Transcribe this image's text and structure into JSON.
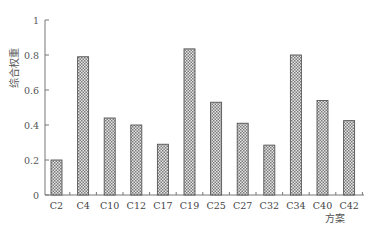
{
  "chart_data": {
    "type": "bar",
    "title": "",
    "xlabel": "方案",
    "ylabel": "综合权重",
    "ylim": [
      0,
      1
    ],
    "yticks": [
      0,
      0.2,
      0.4,
      0.6,
      0.8,
      1
    ],
    "ytick_labels": [
      "0",
      "0.2",
      "0.4",
      "0.6",
      "0.8",
      "1"
    ],
    "grid": false,
    "legend": null,
    "categories": [
      "C2",
      "C4",
      "C10",
      "C12",
      "C17",
      "C19",
      "C25",
      "C27",
      "C32",
      "C34",
      "C40",
      "C42"
    ],
    "values": [
      0.2,
      0.79,
      0.44,
      0.4,
      0.29,
      0.835,
      0.53,
      0.41,
      0.285,
      0.8,
      0.54,
      0.425
    ],
    "bar_fill": "crosshatch",
    "colors": {
      "bar_border": "#555555",
      "bar_dark": "#7a7a7a",
      "bar_light": "#e6e6e6",
      "axis": "#777777"
    }
  }
}
